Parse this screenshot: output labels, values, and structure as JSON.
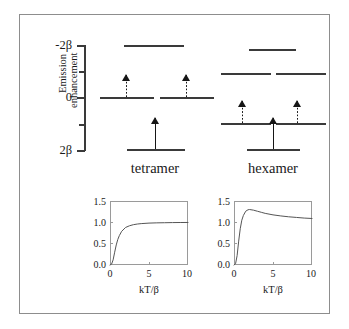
{
  "figure": {
    "caption_free": true
  },
  "mo_diagram": {
    "energy_axis": {
      "labels": [
        {
          "text": "-2β",
          "value": -2
        },
        {
          "text": "0",
          "value": 0
        },
        {
          "text": "2β",
          "value": 2
        }
      ],
      "tick_values": [
        -2,
        -1,
        0,
        1,
        2
      ],
      "unit": "β"
    },
    "species": [
      {
        "name": "tetramer",
        "label": "tetramer",
        "n_sites": 4,
        "levels": [
          {
            "energy": -2,
            "degeneracy": 1,
            "electrons": 0,
            "occupancy": "empty"
          },
          {
            "energy": 0,
            "degeneracy": 2,
            "electrons": 2,
            "occupancy": "singly-occupied-pair"
          },
          {
            "energy": 2,
            "degeneracy": 1,
            "electrons": 1,
            "occupancy": "single"
          }
        ]
      },
      {
        "name": "hexamer",
        "label": "hexamer",
        "n_sites": 6,
        "levels": [
          {
            "energy": -2,
            "degeneracy": 1,
            "electrons": 0,
            "occupancy": "empty"
          },
          {
            "energy": -1,
            "degeneracy": 2,
            "electrons": 0,
            "occupancy": "empty"
          },
          {
            "energy": 1,
            "degeneracy": 2,
            "electrons": 2,
            "occupancy": "singly-occupied-pair"
          },
          {
            "energy": 2,
            "degeneracy": 1,
            "electrons": 1,
            "occupancy": "single"
          }
        ]
      }
    ]
  },
  "chart_data": [
    {
      "type": "line",
      "id": "tetramer-plot",
      "title": "",
      "xlabel": "kT/β",
      "ylabel": "Emission enhancement",
      "ylabel_lines": [
        "Emission",
        "enhancement"
      ],
      "xlim": [
        0,
        10
      ],
      "ylim": [
        0.0,
        1.5
      ],
      "xticks": [
        0,
        5,
        10
      ],
      "xtick_labels": [
        "0",
        "5",
        "10"
      ],
      "yticks": [
        0.0,
        0.5,
        1.0,
        1.5
      ],
      "ytick_labels": [
        "0.0",
        "0.5",
        "1.0",
        "1.5"
      ],
      "grid": false,
      "legend": null,
      "series": [
        {
          "name": "tetramer",
          "x": [
            0.0,
            0.2,
            0.4,
            0.6,
            0.8,
            1.0,
            1.2,
            1.5,
            2.0,
            2.5,
            3.0,
            3.5,
            4.0,
            5.0,
            6.0,
            7.0,
            8.0,
            9.0,
            10.0
          ],
          "y": [
            0.0,
            0.02,
            0.12,
            0.3,
            0.47,
            0.6,
            0.69,
            0.79,
            0.88,
            0.92,
            0.945,
            0.96,
            0.97,
            0.982,
            0.988,
            0.991,
            0.994,
            0.996,
            0.997
          ]
        }
      ]
    },
    {
      "type": "line",
      "id": "hexamer-plot",
      "title": "",
      "xlabel": "kT/β",
      "ylabel": "Emission enhancement",
      "ylabel_lines": [
        "Emission",
        "enhancement"
      ],
      "xlim": [
        0,
        10
      ],
      "ylim": [
        0.0,
        1.5
      ],
      "xticks": [
        0,
        5,
        10
      ],
      "xtick_labels": [
        "0",
        "5",
        "10"
      ],
      "yticks": [
        0.0,
        0.5,
        1.0,
        1.5
      ],
      "ytick_labels": [
        "0.0",
        "0.5",
        "1.0",
        "1.5"
      ],
      "grid": false,
      "legend": null,
      "series": [
        {
          "name": "hexamer",
          "x": [
            0.0,
            0.2,
            0.4,
            0.6,
            0.8,
            1.0,
            1.2,
            1.5,
            1.8,
            2.0,
            2.5,
            3.0,
            3.5,
            4.0,
            5.0,
            6.0,
            7.0,
            8.0,
            9.0,
            10.0
          ],
          "y": [
            0.0,
            0.03,
            0.22,
            0.56,
            0.85,
            1.05,
            1.16,
            1.26,
            1.295,
            1.3,
            1.285,
            1.26,
            1.235,
            1.21,
            1.175,
            1.15,
            1.13,
            1.115,
            1.1,
            1.09
          ]
        }
      ]
    }
  ]
}
